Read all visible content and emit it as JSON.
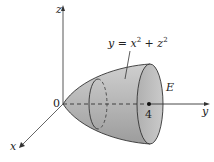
{
  "figure": {
    "equation": {
      "y": "y",
      "eq": " = ",
      "x": "x",
      "plus": " + ",
      "z": "z",
      "exp": "2"
    },
    "region_label": "E",
    "axes": {
      "x_label": "x",
      "y_label": "y",
      "z_label": "z",
      "origin_label": "0"
    },
    "marked_point_label": "4",
    "colors": {
      "surface_fill": "#b9b9b9",
      "surface_shade": "#9a9a9a",
      "cap_fill": "#c4c4c4",
      "line": "#333333"
    }
  }
}
